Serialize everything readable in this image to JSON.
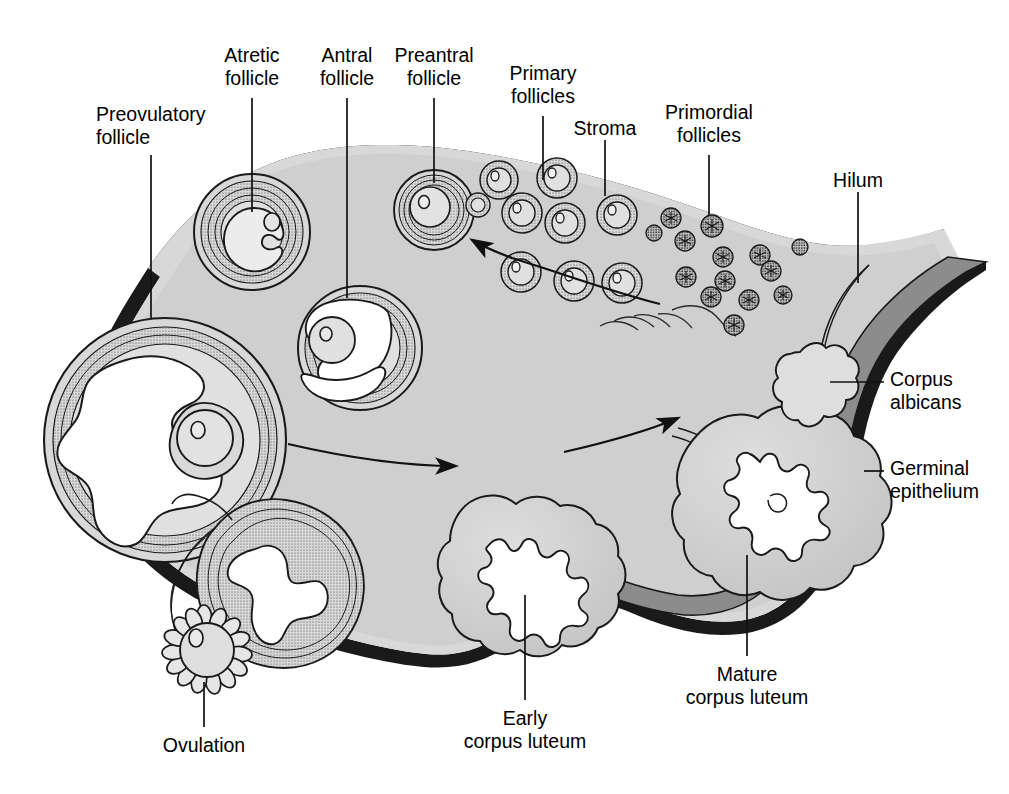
{
  "figure": {
    "type": "anatomical-diagram",
    "colors": {
      "stroma_fill": "#cfcfcf",
      "cortex_fill": "#d6d6d6",
      "follicle_fill": "#dcdcdc",
      "antrum_fill": "#ffffff",
      "vessel_fill": "#8c8c8c",
      "outline": "#1a1a1a",
      "label_text": "#000000",
      "background": "#ffffff"
    }
  },
  "labels": [
    {
      "id": "preovulatory-follicle",
      "line1": "Preovulatory",
      "line2": "follicle",
      "align": "left",
      "x": 96,
      "y": 103,
      "leader": {
        "x1": 151,
        "y1": 155,
        "x2": 151,
        "y2": 318
      }
    },
    {
      "id": "atretic-follicle",
      "line1": "Atretic",
      "line2": "follicle",
      "align": "center",
      "x": 223,
      "y": 44,
      "leader": {
        "x1": 252,
        "y1": 98,
        "x2": 252,
        "y2": 212
      }
    },
    {
      "id": "antral-follicle",
      "line1": "Antral",
      "line2": "follicle",
      "align": "center",
      "x": 318,
      "y": 44,
      "leader": {
        "x1": 347,
        "y1": 98,
        "x2": 347,
        "y2": 298
      }
    },
    {
      "id": "preantral-follicle",
      "line1": "Preantral",
      "line2": "follicle",
      "align": "center",
      "x": 394,
      "y": 44,
      "leader": {
        "x1": 434,
        "y1": 98,
        "x2": 434,
        "y2": 183
      }
    },
    {
      "id": "primary-follicles",
      "line1": "Primary",
      "line2": "follicles",
      "align": "center",
      "x": 513,
      "y": 62,
      "leader": {
        "x1": 543,
        "y1": 116,
        "x2": 543,
        "y2": 180
      }
    },
    {
      "id": "stroma",
      "line1": "Stroma",
      "line2": "",
      "align": "center",
      "x": 577,
      "y": 117,
      "leader": {
        "x1": 605,
        "y1": 140,
        "x2": 605,
        "y2": 196
      }
    },
    {
      "id": "primordial-follicles",
      "line1": "Primordial",
      "line2": "follicles",
      "align": "center",
      "x": 685,
      "y": 101,
      "leader": {
        "x1": 709,
        "y1": 155,
        "x2": 709,
        "y2": 215
      }
    },
    {
      "id": "hilum",
      "line1": "Hilum",
      "line2": "",
      "align": "center",
      "x": 824,
      "y": 169,
      "leader": {
        "x1": 858,
        "y1": 192,
        "x2": 858,
        "y2": 283
      }
    },
    {
      "id": "corpus-albicans",
      "line1": "Corpus",
      "line2": "albicans",
      "align": "left",
      "x": 890,
      "y": 368,
      "leader": {
        "x1": 830,
        "y1": 382,
        "x2": 884,
        "y2": 382
      }
    },
    {
      "id": "germinal-epithelium",
      "line1": "Germinal",
      "line2": "epithelium",
      "align": "left",
      "x": 890,
      "y": 457,
      "leader": {
        "x1": 864,
        "y1": 471,
        "x2": 884,
        "y2": 471
      }
    },
    {
      "id": "ovulation",
      "line1": "Ovulation",
      "line2": "",
      "align": "center",
      "x": 166,
      "y": 734,
      "leader": {
        "x1": 204,
        "y1": 682,
        "x2": 204,
        "y2": 727
      }
    },
    {
      "id": "early-corpus-luteum",
      "line1": "Early",
      "line2": "corpus luteum",
      "align": "center",
      "x": 448,
      "y": 707,
      "leader": {
        "x1": 525,
        "y1": 595,
        "x2": 525,
        "y2": 700
      }
    },
    {
      "id": "mature-corpus-luteum",
      "line1": "Mature",
      "line2": "corpus luteum",
      "align": "center",
      "x": 677,
      "y": 663,
      "leader": {
        "x1": 747,
        "y1": 555,
        "x2": 747,
        "y2": 656
      }
    }
  ],
  "structures": {
    "preovulatory_follicle": "large follicle with irregular antrum and cumulus oophorus",
    "atretic_follicle": "degenerating follicle with collapsed oocyte",
    "antral_follicle": "follicle with crescent-shaped antrum",
    "preantral_follicle": "solid follicle, concentric granulosa layers",
    "primary_follicles": "medium follicles with single granulosa layer",
    "primordial_follicles": "small dark resting follicles",
    "stroma": "ovarian connective tissue",
    "hilum": "vascular entry with blood vessels",
    "corpus_albicans": "regressed white scar body",
    "germinal_epithelium": "outer surface epithelium",
    "ruptured_follicle": "collapsed follicle after ovulation",
    "ovulation": "released ovum with corona radiata",
    "early_corpus_luteum": "newly formed corpus luteum with blood clot cavity",
    "mature_corpus_luteum": "fully developed corpus luteum"
  },
  "arrows": [
    {
      "id": "arrow-maturation",
      "direction": "right-to-left",
      "meaning": "follicle maturation sequence"
    },
    {
      "id": "arrow-ovulation",
      "direction": "left-to-right",
      "meaning": "ovulation to luteinization"
    },
    {
      "id": "arrow-luteal",
      "direction": "left-to-right",
      "meaning": "corpus luteum development"
    }
  ]
}
